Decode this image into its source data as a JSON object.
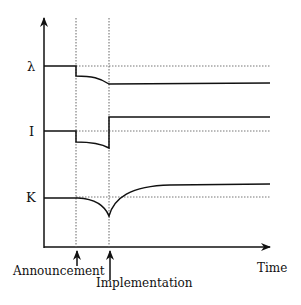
{
  "diagram": {
    "axes": {
      "y_axis_label": "",
      "x_axis_label": "Time"
    },
    "variables": [
      {
        "symbol": "λ",
        "name": "lambda"
      },
      {
        "symbol": "I",
        "name": "investment"
      },
      {
        "symbol": "K",
        "name": "capital"
      }
    ],
    "events": [
      {
        "label": "Announcement"
      },
      {
        "label": "Implementation"
      }
    ],
    "colors": {
      "line": "#111111",
      "dotted": "#666666",
      "background": "#ffffff"
    }
  }
}
